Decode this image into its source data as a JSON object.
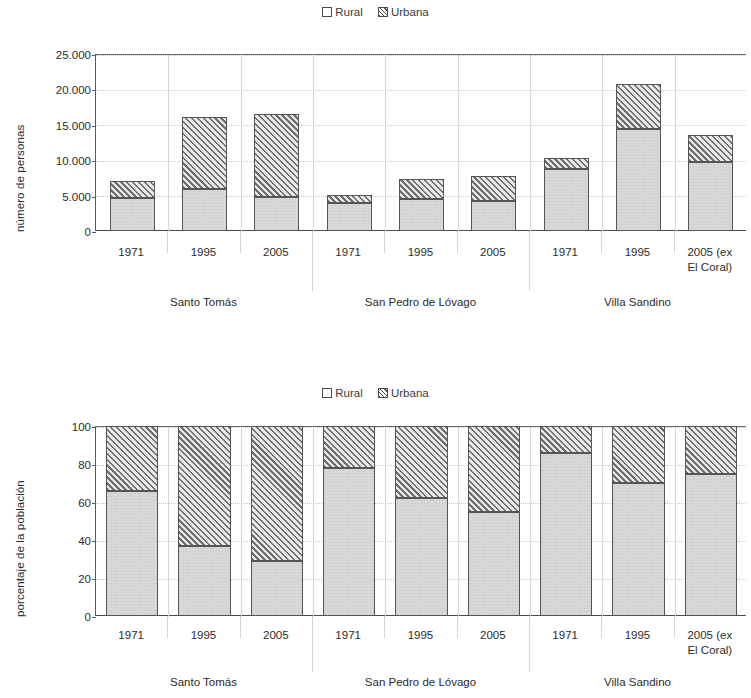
{
  "legend": {
    "items": [
      {
        "label": "Rural",
        "pattern": "solid-light",
        "color": "#d8d8d8"
      },
      {
        "label": "Urbana",
        "pattern": "diagonal-hatch",
        "color": "#6e6e6e"
      }
    ]
  },
  "charts": {
    "top": {
      "ylabel": "número de personas",
      "yticks": [
        "0",
        "5.000",
        "10.000",
        "15.000",
        "20.000",
        "25.000"
      ]
    },
    "bottom": {
      "ylabel": "porcentaje de la población",
      "yticks": [
        "0",
        "20",
        "40",
        "60",
        "80",
        "100"
      ]
    }
  },
  "axis": {
    "categories": [
      "1971",
      "1995",
      "2005",
      "1971",
      "1995",
      "2005",
      "1971",
      "1995",
      "2005 (ex\nEl Coral)"
    ],
    "groups": [
      "Santo Tomás",
      "San Pedro de Lóvago",
      "Villa Sandino"
    ]
  },
  "chart_data": [
    {
      "type": "bar",
      "stacked": true,
      "title": "",
      "xlabel": "",
      "ylabel": "número de personas",
      "ylim": [
        0,
        25000
      ],
      "yticks": [
        0,
        5000,
        10000,
        15000,
        20000,
        25000
      ],
      "grid": true,
      "legend_position": "top-center",
      "categories": [
        "Santo Tomás 1971",
        "Santo Tomás 1995",
        "Santo Tomás 2005",
        "San Pedro de Lóvago 1971",
        "San Pedro de Lóvago 1995",
        "San Pedro de Lóvago 2005",
        "Villa Sandino 1971",
        "Villa Sandino 1995",
        "Villa Sandino 2005 (ex El Coral)"
      ],
      "series": [
        {
          "name": "Rural",
          "values": [
            4650,
            5950,
            4800,
            3950,
            4500,
            4300,
            8800,
            14400,
            9800
          ]
        },
        {
          "name": "Urbana",
          "values": [
            2350,
            10150,
            11700,
            1150,
            2800,
            3500,
            1550,
            6400,
            3700
          ]
        }
      ],
      "totals": [
        7000,
        16100,
        16500,
        5100,
        7300,
        7800,
        10350,
        20800,
        13500
      ]
    },
    {
      "type": "bar",
      "stacked": true,
      "percent": true,
      "title": "",
      "xlabel": "",
      "ylabel": "porcentaje de la población",
      "ylim": [
        0,
        100
      ],
      "yticks": [
        0,
        20,
        40,
        60,
        80,
        100
      ],
      "grid": true,
      "legend_position": "top-center",
      "categories": [
        "Santo Tomás 1971",
        "Santo Tomás 1995",
        "Santo Tomás 2005",
        "San Pedro de Lóvago 1971",
        "San Pedro de Lóvago 1995",
        "San Pedro de Lóvago 2005",
        "Villa Sandino 1971",
        "Villa Sandino 1995",
        "Villa Sandino 2005 (ex El Coral)"
      ],
      "series": [
        {
          "name": "Rural",
          "values": [
            66,
            37,
            29,
            78,
            62,
            55,
            86,
            70,
            75
          ]
        },
        {
          "name": "Urbana",
          "values": [
            34,
            63,
            71,
            22,
            38,
            45,
            14,
            30,
            25
          ]
        }
      ]
    }
  ]
}
